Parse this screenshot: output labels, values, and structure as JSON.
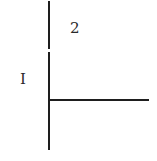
{
  "diagram": {
    "type": "region-divider",
    "labels": [
      {
        "id": "region-1",
        "text": "I"
      },
      {
        "id": "region-2",
        "text": "2"
      }
    ],
    "lines": [
      {
        "id": "vertical-upper",
        "orientation": "vertical"
      },
      {
        "id": "vertical-lower",
        "orientation": "vertical"
      },
      {
        "id": "horizontal",
        "orientation": "horizontal"
      }
    ],
    "colors": {
      "line": "#1e1e1e",
      "text": "#2a2a2a",
      "background": "#ffffff"
    }
  }
}
